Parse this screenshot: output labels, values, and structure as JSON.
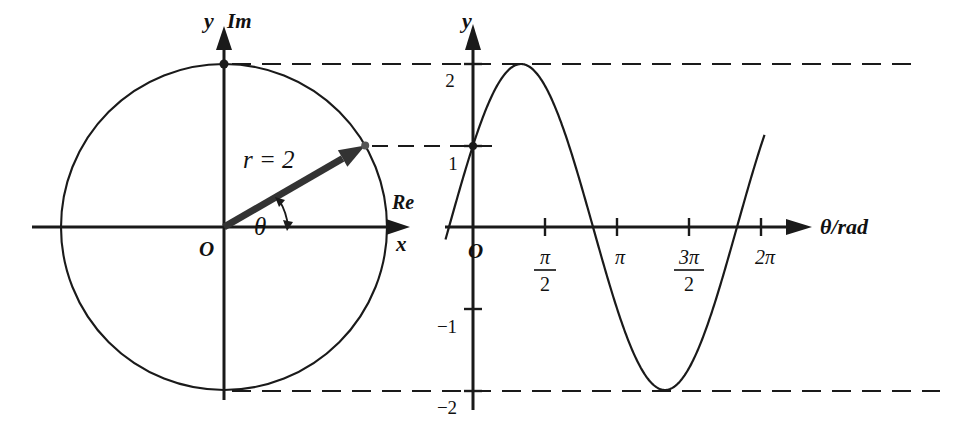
{
  "figure": {
    "title": "",
    "background_color": "#ffffff",
    "ink_color": "#1a1a1a"
  },
  "left_panel": {
    "name": "argand-diagram",
    "axis_y_label": "y",
    "axis_im_label": "Im",
    "axis_re_label": "Re",
    "axis_x_label": "x",
    "origin_label": "O",
    "radius_label": "r = 2",
    "angle_label": "θ",
    "circle": {
      "center_x": 224,
      "center_y": 227,
      "radius": 163
    },
    "vector": {
      "angle_deg": 30,
      "length": 2,
      "tip_x": 367,
      "tip_y": 146
    },
    "markers": [
      {
        "label": "top-of-circle",
        "x": 224,
        "y": 64
      },
      {
        "label": "vector-tip",
        "x": 367,
        "y": 146
      }
    ]
  },
  "right_panel": {
    "name": "sine-graph",
    "axis_y_label": "y",
    "axis_x_label": "θ/rad",
    "origin_label": "O",
    "y_ticks": [
      "2",
      "1",
      "−1",
      "−2"
    ],
    "x_ticks": [
      {
        "num": "π",
        "den": "2"
      },
      {
        "num": "π",
        "den": ""
      },
      {
        "num": "3π",
        "den": "2"
      },
      {
        "num": "2π",
        "den": ""
      }
    ]
  },
  "chart_data": {
    "type": "line",
    "title": "",
    "xlabel": "θ/rad",
    "ylabel": "y",
    "xlim": [
      0,
      6.283185
    ],
    "ylim": [
      -2.4,
      2.4
    ],
    "grid": false,
    "legend": "none",
    "xticks": [
      1.570796,
      3.141593,
      4.712389,
      6.283185
    ],
    "xticklabels": [
      "π/2",
      "π",
      "3π/2",
      "2π"
    ],
    "yticks": [
      2,
      1,
      -1,
      -2
    ],
    "yticklabels": [
      "2",
      "1",
      "−1",
      "−2"
    ],
    "series": [
      {
        "name": "y = 2 sin(θ + π/6)",
        "amplitude": 2,
        "phase_rad": 0.523599,
        "y_at_zero": 1,
        "maximum": {
          "x": 1.047198,
          "y": 2
        },
        "minimum": {
          "x": 4.18879,
          "y": -2
        },
        "zeros": [
          2.617994,
          5.759587
        ]
      }
    ],
    "annotations": [
      {
        "text": "r = 2",
        "kind": "vector-length"
      },
      {
        "text": "θ",
        "kind": "angle"
      },
      {
        "text": "Im",
        "kind": "axis"
      },
      {
        "text": "Re",
        "kind": "axis"
      }
    ],
    "reference_lines": [
      {
        "y": 2,
        "style": "dashed"
      },
      {
        "y": 1,
        "style": "dashed"
      },
      {
        "y": -2,
        "style": "dashed"
      }
    ]
  }
}
